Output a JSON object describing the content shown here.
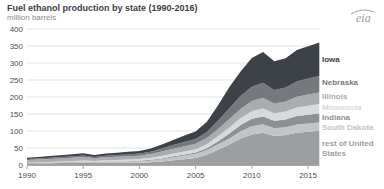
{
  "logo": {
    "text": "eia",
    "color": "#939a9e"
  },
  "chart_data": {
    "type": "area",
    "stacked": true,
    "title": "Fuel ethanol production by state (1990-2016)",
    "subtitle": "million barrels",
    "xlabel": "",
    "ylabel": "million barrels",
    "x": [
      1990,
      1991,
      1992,
      1993,
      1994,
      1995,
      1996,
      1997,
      1998,
      1999,
      2000,
      2001,
      2002,
      2003,
      2004,
      2005,
      2006,
      2007,
      2008,
      2009,
      2010,
      2011,
      2012,
      2013,
      2014,
      2015,
      2016
    ],
    "x_ticks": [
      1990,
      1995,
      2000,
      2005,
      2010,
      2015
    ],
    "y_ticks": [
      0,
      50,
      100,
      150,
      200,
      250,
      300,
      350,
      400
    ],
    "ylim": [
      0,
      400
    ],
    "xlim": [
      1990,
      2016
    ],
    "grid": "horizontal",
    "gridline_color": "#e2e2e2",
    "axis_color": "#a6a6a6",
    "tick_label_color": "#4d4d4d",
    "legend_position": "right",
    "series": [
      {
        "name": "Iowa",
        "color": "#3d4148",
        "values": [
          4,
          4.5,
          5,
          5.5,
          6,
          6.5,
          5.5,
          6.5,
          7,
          7.5,
          8,
          9,
          12,
          15,
          19,
          22,
          30,
          45,
          62,
          72,
          85,
          90,
          84,
          86,
          92,
          95,
          98
        ]
      },
      {
        "name": "Nebraska",
        "color": "#75797e",
        "values": [
          3,
          3.2,
          3.5,
          3.8,
          4,
          4.5,
          4,
          4.5,
          5,
          5.5,
          6,
          7,
          9,
          11,
          13,
          14,
          18,
          25,
          32,
          38,
          42,
          45,
          40,
          41,
          45,
          47,
          49
        ]
      },
      {
        "name": "Illinois",
        "color": "#aaadaf",
        "values": [
          8,
          8.5,
          9,
          9.5,
          10,
          10.5,
          7.5,
          9,
          9.5,
          10,
          10,
          11,
          13,
          14,
          15,
          16,
          18,
          21,
          25,
          27,
          30,
          31,
          29,
          30,
          32,
          33,
          34
        ]
      },
      {
        "name": "Minnesota",
        "color": "#d8d9da",
        "values": [
          1,
          1.3,
          1.7,
          2,
          2.5,
          3,
          3.2,
          3.6,
          4,
          4.5,
          5,
          6,
          7,
          8,
          9,
          10,
          12,
          15,
          17,
          20,
          22,
          23,
          22,
          23,
          25,
          26,
          27
        ]
      },
      {
        "name": "Indiana",
        "color": "#8d9094",
        "values": [
          1,
          1,
          1.1,
          1.2,
          1.3,
          1.4,
          1.3,
          1.5,
          1.6,
          1.8,
          2,
          2.2,
          2.5,
          2.8,
          3,
          3.5,
          5,
          9,
          15,
          19,
          22,
          23,
          22,
          23,
          25,
          26,
          27
        ]
      },
      {
        "name": "South Dakota",
        "color": "#c2c4c5",
        "values": [
          0.5,
          0.7,
          1,
          1.3,
          1.6,
          2,
          2.2,
          2.6,
          3,
          3.5,
          4,
          5,
          7,
          9,
          11,
          12,
          14,
          16,
          18,
          21,
          24,
          25,
          23,
          23,
          24,
          24,
          24
        ]
      },
      {
        "name": "rest of United States",
        "color": "#9c9ea0",
        "values": [
          4,
          4.5,
          5,
          5.5,
          6,
          6.5,
          5.5,
          6,
          6,
          6,
          6.5,
          8,
          10,
          14,
          17,
          21,
          30,
          45,
          60,
          78,
          90,
          95,
          85,
          88,
          95,
          98,
          101
        ]
      }
    ]
  }
}
